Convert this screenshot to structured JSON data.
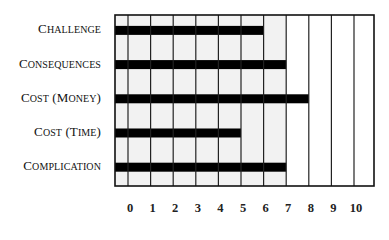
{
  "chart_data": {
    "type": "bar",
    "orientation": "horizontal",
    "title": "",
    "xlabel": "",
    "ylabel": "",
    "categories": [
      "Challenge",
      "Consequences",
      "Cost (Money)",
      "Cost (Time)",
      "Complication"
    ],
    "values": [
      6,
      7,
      8,
      5,
      7
    ],
    "xlim": [
      0,
      10
    ],
    "x_ticks": [
      "0",
      "1",
      "2",
      "3",
      "4",
      "5",
      "6",
      "7",
      "8",
      "9",
      "10"
    ],
    "grid": true,
    "bar_color": "#000000",
    "grid_color": "#222222",
    "shaded_region_color": "#f2f2f2",
    "shaded_region_end": 7
  }
}
